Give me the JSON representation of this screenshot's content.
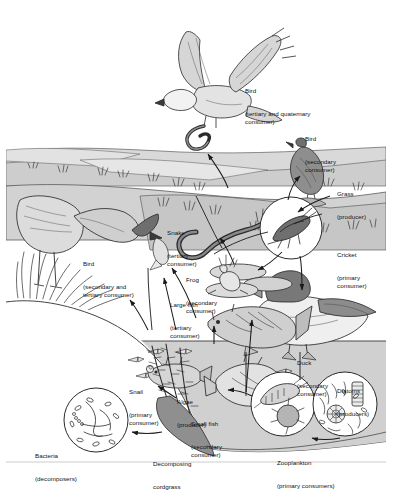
{
  "figure": {
    "domain": "Diagram",
    "width": 404,
    "height": 482,
    "background": "#ffffff",
    "ink": "#1a1a1a",
    "tones": {
      "sky": "#ffffff",
      "upland": "#d8d8d8",
      "midground": "#c9c9c9",
      "water": "#cfcfcf",
      "mud": "#9a9a9a",
      "dark_animal": "#8c8c8c",
      "light_animal": "#d0d0d0"
    }
  },
  "labels": [
    {
      "id": "bird-osprey",
      "name": "Bird",
      "role": "(tertiary and quaternary\nconsumer)",
      "x": 245,
      "y": 72
    },
    {
      "id": "bird-secondary",
      "name": "Bird",
      "role": "(secondary\nconsumer)",
      "x": 305,
      "y": 120
    },
    {
      "id": "grass",
      "name": "Grass",
      "role": "(producer)",
      "x": 337,
      "y": 175
    },
    {
      "id": "cricket",
      "name": "Cricket",
      "role": "(primary\nconsumer)",
      "x": 337,
      "y": 236
    },
    {
      "id": "snake",
      "name": "Snake",
      "role": "(tertiary\nconsumer)",
      "x": 167,
      "y": 214
    },
    {
      "id": "frog",
      "name": "Frog",
      "role": "(secondary\nconsumer)",
      "x": 186,
      "y": 261
    },
    {
      "id": "bird-heron",
      "name": "Bird",
      "role": "(secondary and\ntertiary consumer)",
      "x": 83,
      "y": 245
    },
    {
      "id": "large-fish",
      "name": "Large fish",
      "role": "(tertiary\nconsumer)",
      "x": 170,
      "y": 286
    },
    {
      "id": "duck",
      "name": "Duck",
      "role": "(secondary\nconsumer)",
      "x": 297,
      "y": 344
    },
    {
      "id": "diatoms",
      "name": "Diatoms",
      "role": "(producers)",
      "x": 337,
      "y": 372
    },
    {
      "id": "snail",
      "name": "Snail",
      "role": "(primary\nconsumer)",
      "x": 129,
      "y": 373
    },
    {
      "id": "algae",
      "name": "Algae",
      "role": "(producer)",
      "x": 177,
      "y": 383
    },
    {
      "id": "small-fish",
      "name": "Small fish",
      "role": "(secondary\nconsumer)",
      "x": 191,
      "y": 405
    },
    {
      "id": "zooplankton",
      "name": "Zooplankton",
      "role": "(primary consumers)",
      "x": 277,
      "y": 444
    },
    {
      "id": "bacteria",
      "name": "Bacteria",
      "role": "(decomposers)",
      "x": 35,
      "y": 437
    },
    {
      "id": "cordgrass",
      "name": "Decomposing",
      "role": "cordgrass",
      "x": 153,
      "y": 445
    }
  ],
  "organisms": [
    {
      "id": "osprey",
      "label": "Bird (tertiary and quaternary consumer)"
    },
    {
      "id": "songbird",
      "label": "Bird (secondary consumer)"
    },
    {
      "id": "heron",
      "label": "Bird (secondary and tertiary consumer)"
    },
    {
      "id": "snake",
      "label": "Snake (tertiary consumer)"
    },
    {
      "id": "frog",
      "label": "Frog (secondary consumer)"
    },
    {
      "id": "cricket",
      "label": "Cricket (primary consumer)"
    },
    {
      "id": "grass",
      "label": "Grass (producer)"
    },
    {
      "id": "duck",
      "label": "Duck (secondary consumer)"
    },
    {
      "id": "large-fish",
      "label": "Large fish (tertiary consumer)"
    },
    {
      "id": "small-fish",
      "label": "Small fish (secondary consumer)"
    },
    {
      "id": "snail",
      "label": "Snail (primary consumer)"
    },
    {
      "id": "algae",
      "label": "Algae (producer)"
    },
    {
      "id": "diatoms",
      "label": "Diatoms (producers)"
    },
    {
      "id": "zooplankton",
      "label": "Zooplankton (primary consumers)"
    },
    {
      "id": "bacteria",
      "label": "Bacteria (decomposers)"
    },
    {
      "id": "cordgrass",
      "label": "Decomposing cordgrass"
    }
  ]
}
